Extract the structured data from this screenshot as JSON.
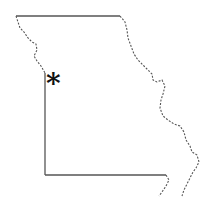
{
  "map": {
    "region": "Missouri state outline",
    "outline_color": "#555555",
    "background": "#ffffff"
  },
  "marker": {
    "symbol": "*",
    "color": "#111111",
    "x": 46,
    "y": 70
  }
}
